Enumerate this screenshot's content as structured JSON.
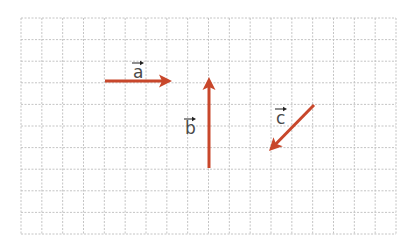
{
  "diagram": {
    "type": "vectors-on-grid",
    "grid": {
      "left": 21,
      "top": 18,
      "right": 396,
      "bottom": 234,
      "columns": 18,
      "rows": 10,
      "line_color": "#bdbdbd",
      "dash": "2,1.5"
    },
    "arrow_color": "#c8472b",
    "label_color": "#4a4a4a",
    "vectors": [
      {
        "name": "a",
        "label": "a",
        "x1": 105,
        "y1": 81,
        "x2": 172,
        "y2": 81,
        "label_x": 133,
        "label_y": 78,
        "units": "3 right"
      },
      {
        "name": "b",
        "label": "b",
        "x1": 209,
        "y1": 168,
        "x2": 209,
        "y2": 77,
        "label_x": 185,
        "label_y": 134,
        "units": "4 up"
      },
      {
        "name": "c",
        "label": "c",
        "x1": 314,
        "y1": 105,
        "x2": 269,
        "y2": 151,
        "label_x": 276,
        "label_y": 124,
        "units": "2 left, 2 down"
      }
    ]
  }
}
